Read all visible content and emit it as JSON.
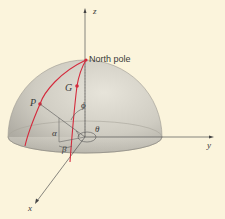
{
  "diagram": {
    "labels": {
      "z_axis": "z",
      "y_axis": "y",
      "x_axis": "x",
      "north_pole": "North pole",
      "point_p": "P",
      "point_g": "G",
      "angle_phi": "ϕ",
      "angle_theta": "θ",
      "angle_alpha": "α",
      "angle_beta": "β"
    },
    "colors": {
      "background": "#fbf4dc",
      "dome": "#c9c6bc",
      "meridian": "#d42a3c",
      "axis": "#555555"
    }
  }
}
